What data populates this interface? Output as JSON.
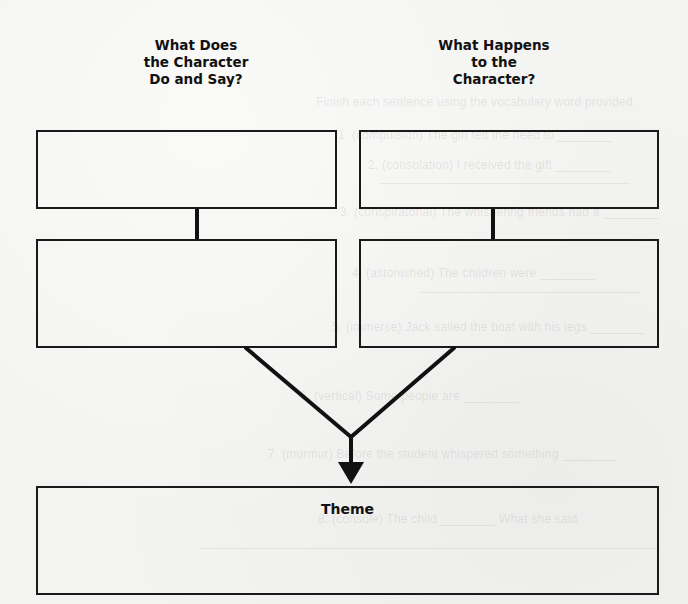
{
  "worksheet": {
    "left_column": {
      "heading_lines": [
        "What Does",
        "the Character",
        "Do and Say?"
      ]
    },
    "right_column": {
      "heading_lines": [
        "What Happens",
        "to the",
        "Character?"
      ]
    },
    "theme_box": {
      "label": "Theme"
    }
  },
  "ghost_text": {
    "lines": [
      "Finish each sentence using the vocabulary word provided.",
      "1. (compulsion) The girl felt the need to ________",
      "2. (consolation) I received the gift ________",
      "3. (conspiratorial) The whispering friends had a ________",
      "4. (astonished) The children were ________",
      "5. (immerse) Jack sailed the boat with his legs ________",
      "6. (vertical) Some people are ________",
      "7. (murmur) Before the student whispered something ________",
      "8. (console) The child ________ What she said"
    ]
  },
  "colors": {
    "ink": "#1a1a1a",
    "paper": "#f3f3f1"
  }
}
